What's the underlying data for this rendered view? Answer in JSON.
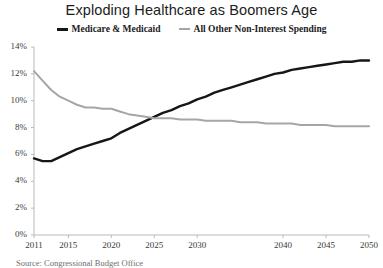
{
  "chart_data": {
    "type": "line",
    "title": "Exploding Healthcare as Boomers Age",
    "xlabel": "",
    "ylabel": "",
    "xlim": [
      2011,
      2050
    ],
    "ylim": [
      0,
      14
    ],
    "grid": false,
    "legend_position": "top-center",
    "y_tick_labels": [
      "0%",
      "2%",
      "4%",
      "6%",
      "8%",
      "10%",
      "12%",
      "14%"
    ],
    "y_tick_values": [
      0,
      2,
      4,
      6,
      8,
      10,
      12,
      14
    ],
    "x_tick_labels": [
      "2011",
      "2015",
      "2020",
      "2025",
      "2030",
      "2040",
      "2045",
      "2050"
    ],
    "x_tick_values": [
      2011,
      2015,
      2020,
      2025,
      2030,
      2040,
      2045,
      2050
    ],
    "x": [
      2011,
      2012,
      2013,
      2014,
      2015,
      2016,
      2017,
      2018,
      2019,
      2020,
      2021,
      2022,
      2023,
      2024,
      2025,
      2026,
      2027,
      2028,
      2029,
      2030,
      2031,
      2032,
      2033,
      2034,
      2035,
      2036,
      2037,
      2038,
      2039,
      2040,
      2041,
      2042,
      2043,
      2044,
      2045,
      2046,
      2047,
      2048,
      2049,
      2050
    ],
    "series": [
      {
        "name": "Medicare & Medicaid",
        "color": "#161616",
        "values": [
          5.7,
          5.5,
          5.5,
          5.8,
          6.1,
          6.4,
          6.6,
          6.8,
          7.0,
          7.2,
          7.6,
          7.9,
          8.2,
          8.5,
          8.8,
          9.1,
          9.3,
          9.6,
          9.8,
          10.1,
          10.3,
          10.6,
          10.8,
          11.0,
          11.2,
          11.4,
          11.6,
          11.8,
          12.0,
          12.1,
          12.3,
          12.4,
          12.5,
          12.6,
          12.7,
          12.8,
          12.9,
          12.9,
          13.0,
          13.0
        ]
      },
      {
        "name": "All Other Non-Interest Spending",
        "color": "#a6a6a6",
        "values": [
          12.2,
          11.5,
          10.8,
          10.3,
          10.0,
          9.7,
          9.5,
          9.5,
          9.4,
          9.4,
          9.2,
          9.0,
          8.9,
          8.8,
          8.7,
          8.7,
          8.7,
          8.6,
          8.6,
          8.6,
          8.5,
          8.5,
          8.5,
          8.5,
          8.4,
          8.4,
          8.4,
          8.3,
          8.3,
          8.3,
          8.3,
          8.2,
          8.2,
          8.2,
          8.2,
          8.1,
          8.1,
          8.1,
          8.1,
          8.1
        ]
      }
    ]
  },
  "source_note": "Source: Congressional Budget Office"
}
